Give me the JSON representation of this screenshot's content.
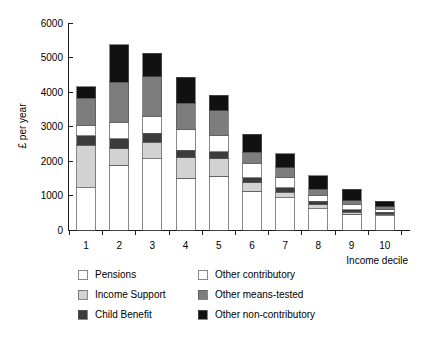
{
  "chart_data": {
    "type": "bar",
    "stacked": true,
    "title": "",
    "xlabel": "Income decile",
    "ylabel": "£ per year",
    "categories": [
      "1",
      "2",
      "3",
      "4",
      "5",
      "6",
      "7",
      "8",
      "9",
      "10"
    ],
    "ylim": [
      0,
      6000
    ],
    "yticks": [
      0,
      1000,
      2000,
      3000,
      4000,
      5000,
      6000
    ],
    "ytick_labels": [
      "0",
      "1000",
      "2000",
      "3000",
      "4000",
      "5000",
      "6000"
    ],
    "grid": false,
    "legend_position": "below",
    "series": [
      {
        "name": "Pensions",
        "color": "#ffffff",
        "values": [
          1230,
          1870,
          2060,
          1500,
          1560,
          1120,
          930,
          620,
          450,
          420
        ]
      },
      {
        "name": "Income Support",
        "color": "#d2d2d2",
        "values": [
          1230,
          490,
          490,
          590,
          500,
          250,
          170,
          110,
          60,
          40
        ]
      },
      {
        "name": "Child Benefit",
        "color": "#3c3c3c",
        "values": [
          270,
          290,
          260,
          220,
          210,
          140,
          130,
          100,
          70,
          50
        ]
      },
      {
        "name": "Other contributory",
        "color": "#ffffff",
        "values": [
          310,
          480,
          480,
          590,
          480,
          420,
          290,
          180,
          160,
          80
        ]
      },
      {
        "name": "Other means-tested",
        "color": "#7d7d7d",
        "values": [
          780,
          1150,
          1150,
          770,
          700,
          320,
          290,
          170,
          110,
          90
        ]
      },
      {
        "name": "Other non-contributory",
        "color": "#111111",
        "values": [
          330,
          1090,
          680,
          760,
          460,
          520,
          400,
          390,
          330,
          150
        ]
      }
    ],
    "totals": [
      4150,
      5370,
      5120,
      4430,
      3910,
      2770,
      2210,
      1570,
      1180,
      830
    ]
  },
  "legend": {
    "entries": [
      {
        "label": "Pensions",
        "swatch": "legend-swatch-pensions"
      },
      {
        "label": "Other contributory",
        "swatch": "legend-swatch-other-contributory"
      },
      {
        "label": "Income Support",
        "swatch": "legend-swatch-income-support"
      },
      {
        "label": "Other means-tested",
        "swatch": "legend-swatch-other-means-tested"
      },
      {
        "label": "Child Benefit",
        "swatch": "legend-swatch-child-benefit"
      },
      {
        "label": "Other non-contributory",
        "swatch": "legend-swatch-other-non-contributory"
      }
    ]
  },
  "colors": {
    "pensions": "#ffffff",
    "income_support": "#d2d2d2",
    "child_benefit": "#3c3c3c",
    "other_contributory": "#ffffff",
    "other_means_tested": "#7d7d7d",
    "other_non_contributory": "#111111",
    "axis": "#1a1a1a",
    "outline": "#555555",
    "background": "#ffffff"
  }
}
